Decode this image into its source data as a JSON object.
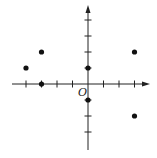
{
  "chart_data": {
    "type": "scatter",
    "title": "",
    "xlabel": "",
    "ylabel": "",
    "origin_label": "O",
    "xlim": [
      -5,
      4
    ],
    "ylim": [
      -4,
      5
    ],
    "x_ticks": [
      -4,
      -3,
      -2,
      -1,
      1,
      2,
      3
    ],
    "y_ticks": [
      -3,
      -2,
      -1,
      1,
      2,
      3,
      4
    ],
    "tick_labels_shown": false,
    "grid": false,
    "legend": null,
    "series": [
      {
        "name": "points",
        "points": [
          {
            "x": -4,
            "y": 1
          },
          {
            "x": -3,
            "y": 2
          },
          {
            "x": -3,
            "y": 0
          },
          {
            "x": 0,
            "y": 1
          },
          {
            "x": 0,
            "y": -1
          },
          {
            "x": 3,
            "y": 2
          },
          {
            "x": 3,
            "y": -2
          }
        ]
      }
    ]
  },
  "style": {
    "axis_color": "#222222",
    "point_color": "#111111"
  }
}
